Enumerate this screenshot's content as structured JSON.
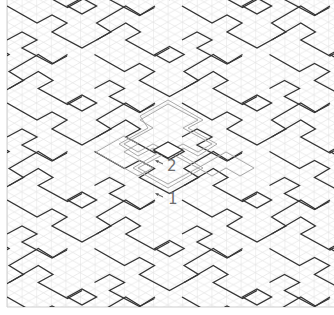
{
  "figure": {
    "grid": {
      "column_spacing": 14.6,
      "half_step": 8.08,
      "color": "#d9d9d9"
    },
    "pattern_line_color": "#333333",
    "highlight_color": "#9a9a9a",
    "labels": [
      {
        "id": "label-1",
        "text": "1",
        "x": 168,
        "y": 192
      },
      {
        "id": "label-2",
        "text": "2",
        "x": 167,
        "y": 159
      }
    ],
    "arrows": [
      {
        "id": "arrow-1",
        "from": [
          163,
          197
        ],
        "to": [
          157,
          194
        ]
      },
      {
        "id": "arrow-2",
        "from": [
          163,
          164
        ],
        "to": [
          157,
          161
        ]
      }
    ]
  }
}
